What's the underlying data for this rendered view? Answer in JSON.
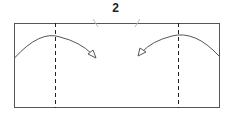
{
  "diagram": {
    "type": "origami-fold-step",
    "step_number": "2",
    "paper": {
      "x": 14,
      "y": 23,
      "width": 205,
      "height": 84,
      "stroke": "#555555"
    },
    "valley_folds": [
      {
        "label": "left-fold-line",
        "x": 55,
        "style": "dashed"
      },
      {
        "label": "right-fold-line",
        "x": 178,
        "style": "dashed"
      }
    ],
    "arrows": [
      {
        "label": "fold-left-flap-right",
        "direction": "right"
      },
      {
        "label": "fold-right-flap-left",
        "direction": "left"
      }
    ],
    "reference_ticks": [
      {
        "label": "left-center-tick",
        "x": 96
      },
      {
        "label": "right-center-tick",
        "x": 136
      }
    ],
    "colors": {
      "line": "#555555",
      "dash": "#222222",
      "tick": "#bbbbbb"
    }
  }
}
